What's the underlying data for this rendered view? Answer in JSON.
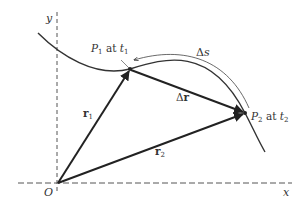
{
  "diagram": {
    "colors": {
      "background": "#ffffff",
      "stroke": "#222222",
      "axis": "#555555",
      "text": "#333333"
    },
    "axes": {
      "y_label": "y",
      "x_label": "x",
      "origin_label": "O"
    },
    "points": {
      "p1": {
        "name": "P",
        "sub": "1",
        "mid": " at ",
        "time": "t",
        "time_sub": "1"
      },
      "p2": {
        "name": "P",
        "sub": "2",
        "mid": " at ",
        "time": "t",
        "time_sub": "2"
      }
    },
    "vectors": {
      "r1": {
        "name": "r",
        "sub": "1"
      },
      "r2": {
        "name": "r",
        "sub": "2"
      },
      "dr": {
        "delta": "Δ",
        "name": "r"
      }
    },
    "arc": {
      "delta": "Δ",
      "name": "s"
    }
  }
}
